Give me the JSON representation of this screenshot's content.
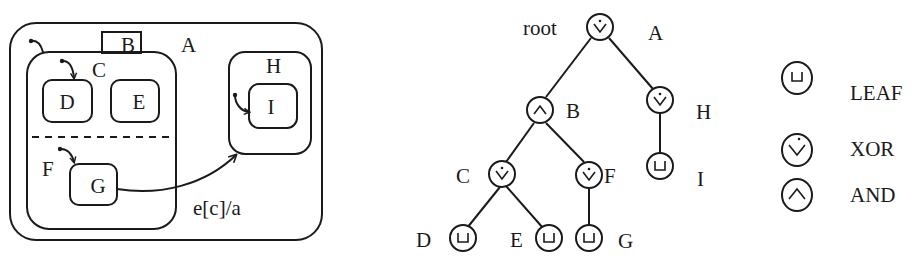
{
  "statechart": {
    "states": {
      "A": "A",
      "B": "B",
      "C": "C",
      "D": "D",
      "E": "E",
      "F": "F",
      "G": "G",
      "H": "H",
      "I": "I"
    },
    "transition_label": "e[c]/a"
  },
  "tree": {
    "root_label": "root",
    "nodes": [
      {
        "id": "A",
        "label": "A",
        "type": "XOR"
      },
      {
        "id": "B",
        "label": "B",
        "type": "AND"
      },
      {
        "id": "H",
        "label": "H",
        "type": "XOR"
      },
      {
        "id": "C",
        "label": "C",
        "type": "XOR"
      },
      {
        "id": "F",
        "label": "F",
        "type": "XOR"
      },
      {
        "id": "I",
        "label": "I",
        "type": "LEAF"
      },
      {
        "id": "D",
        "label": "D",
        "type": "LEAF"
      },
      {
        "id": "E",
        "label": "E",
        "type": "LEAF"
      },
      {
        "id": "G",
        "label": "G",
        "type": "LEAF"
      }
    ]
  },
  "legend": {
    "items": [
      {
        "icon": "leaf-icon",
        "label": "LEAF"
      },
      {
        "icon": "xor-icon",
        "label": "XOR"
      },
      {
        "icon": "and-icon",
        "label": "AND"
      }
    ]
  }
}
